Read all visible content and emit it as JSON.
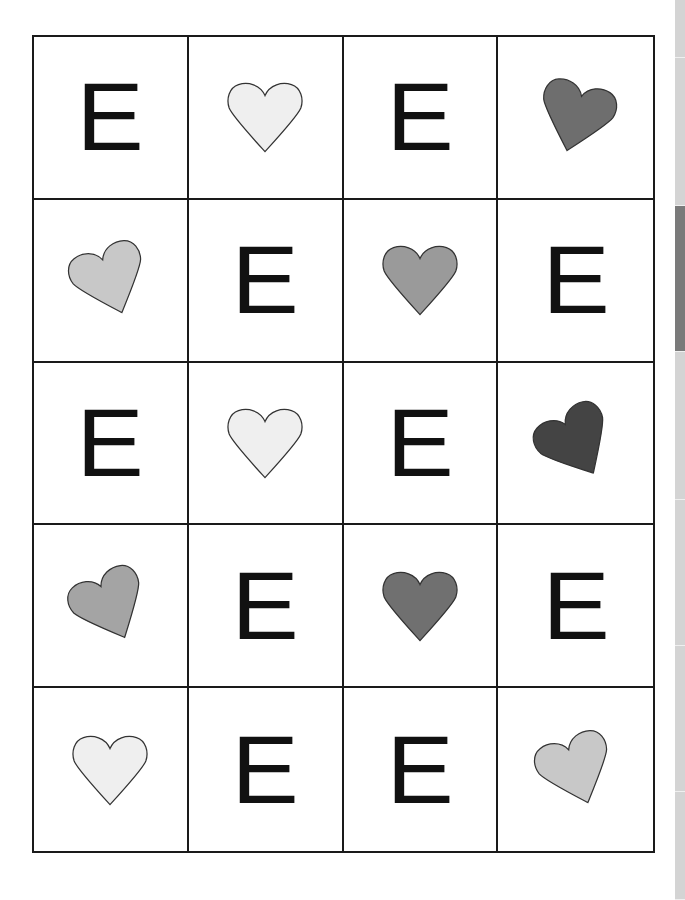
{
  "worksheet": {
    "columns": 4,
    "rows": 5,
    "cells": [
      {
        "type": "letter",
        "text": "E"
      },
      {
        "type": "heart",
        "shade": "very-light",
        "color": "#efefef",
        "rotate": 0
      },
      {
        "type": "letter",
        "text": "E"
      },
      {
        "type": "heart",
        "shade": "medium-dark",
        "color": "#6e6e6e",
        "rotate": 15
      },
      {
        "type": "heart",
        "shade": "light",
        "color": "#c8c8c8",
        "rotate": -20
      },
      {
        "type": "letter",
        "text": "E"
      },
      {
        "type": "heart",
        "shade": "medium",
        "color": "#9a9a9a",
        "rotate": 0
      },
      {
        "type": "letter",
        "text": "E"
      },
      {
        "type": "letter",
        "text": "E"
      },
      {
        "type": "heart",
        "shade": "very-light",
        "color": "#efefef",
        "rotate": 0
      },
      {
        "type": "letter",
        "text": "E"
      },
      {
        "type": "heart",
        "shade": "dark",
        "color": "#444444",
        "rotate": -30
      },
      {
        "type": "heart",
        "shade": "medium",
        "color": "#a4a4a4",
        "rotate": -25
      },
      {
        "type": "letter",
        "text": "E"
      },
      {
        "type": "heart",
        "shade": "medium-dark",
        "color": "#707070",
        "rotate": 0
      },
      {
        "type": "letter",
        "text": "E"
      },
      {
        "type": "heart",
        "shade": "very-light",
        "color": "#efefef",
        "rotate": 0
      },
      {
        "type": "letter",
        "text": "E"
      },
      {
        "type": "letter",
        "text": "E"
      },
      {
        "type": "heart",
        "shade": "light",
        "color": "#c8c8c8",
        "rotate": -20
      }
    ]
  },
  "side_tabs": [
    {
      "top": 0,
      "height": 58,
      "active": false
    },
    {
      "top": 58,
      "height": 148,
      "active": false
    },
    {
      "top": 206,
      "height": 146,
      "active": true
    },
    {
      "top": 352,
      "height": 148,
      "active": false
    },
    {
      "top": 500,
      "height": 146,
      "active": false
    },
    {
      "top": 646,
      "height": 146,
      "active": false
    },
    {
      "top": 792,
      "height": 108,
      "active": false
    }
  ]
}
